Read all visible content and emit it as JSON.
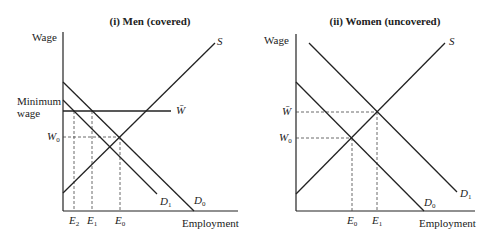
{
  "panels": [
    {
      "title": "(i)  Men (covered)",
      "ylabel": "Wage",
      "xlabel": "Employment",
      "wage_labels": {
        "min_wage_line1": "Minimum",
        "min_wage_line2": "wage",
        "w0": "W",
        "w0_sub": "0",
        "wbar": "W̄"
      },
      "employment_labels": [
        {
          "base": "E",
          "sub": "2"
        },
        {
          "base": "E",
          "sub": "1"
        },
        {
          "base": "E",
          "sub": "0"
        }
      ],
      "curves": {
        "supply": "S",
        "d0": "D",
        "d0_sub": "0",
        "d1": "D",
        "d1_sub": "1"
      }
    },
    {
      "title": "(ii)  Women (uncovered)",
      "ylabel": "Wage",
      "xlabel": "Employment",
      "wage_labels": {
        "wbar": "W̄",
        "w0": "W",
        "w0_sub": "0"
      },
      "employment_labels": [
        {
          "base": "E",
          "sub": "0"
        },
        {
          "base": "E",
          "sub": "1"
        }
      ],
      "curves": {
        "supply": "S",
        "d0": "D",
        "d0_sub": "0",
        "d1": "D",
        "d1_sub": "1"
      }
    }
  ]
}
